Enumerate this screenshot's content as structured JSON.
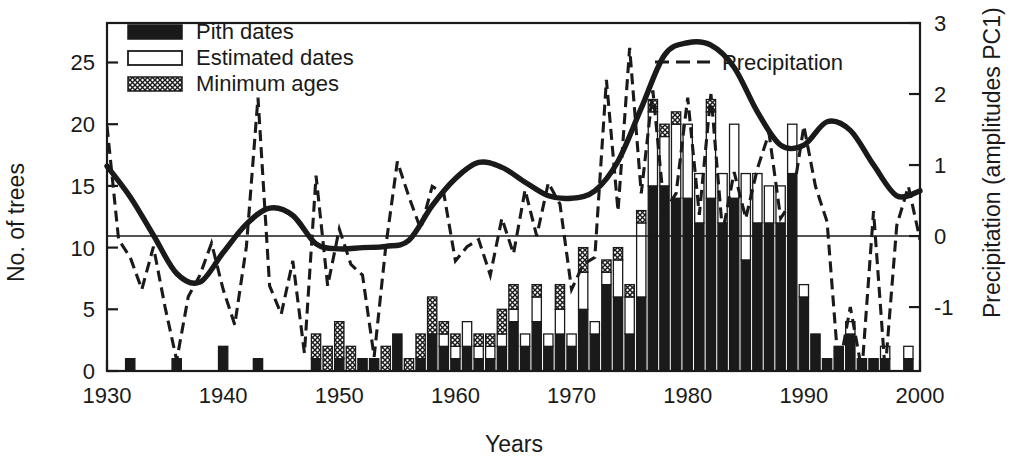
{
  "chart_data": {
    "type": "bar",
    "title": "",
    "xlabel": "Years",
    "ylabel": "No. of trees",
    "y2label": "Precipitation (amplitudes PC1)",
    "xlim": [
      1930,
      2000
    ],
    "ylim": [
      0,
      28.2
    ],
    "y2lim": [
      -1.9,
      3.0
    ],
    "xticks": [
      1930,
      1940,
      1950,
      1960,
      1970,
      1980,
      1990,
      2000
    ],
    "xticklabels": [
      "1930",
      "1940",
      "1950",
      "1960",
      "1970",
      "1980",
      "1990",
      "2000"
    ],
    "yticks": [
      0,
      5,
      10,
      15,
      20,
      25
    ],
    "yticklabels": [
      "0",
      "5",
      "10",
      "15",
      "20",
      "25"
    ],
    "y2ticks": [
      -1,
      0,
      1,
      2,
      3
    ],
    "y2ticklabels": [
      "-1",
      "0",
      "1",
      "2",
      "3"
    ],
    "grid": false,
    "zero_line_y2": 0,
    "legend_position": "top-left and top-right inside axes",
    "colors": {
      "pith": "#1a1a1a",
      "estimated": "#ffffff",
      "minimum": "#b4b4b4",
      "outline": "#1a1a1a",
      "precipitation": "#1a1a1a",
      "smoothed": "#1a1a1a"
    },
    "legend": [
      {
        "label": "Pith dates",
        "swatch": "filled-black"
      },
      {
        "label": "Estimated dates",
        "swatch": "open-white"
      },
      {
        "label": "Minimum ages",
        "swatch": "crosshatch"
      },
      {
        "label": "Precipitation",
        "swatch": "dashed-line"
      }
    ],
    "series": [
      {
        "name": "Pith dates",
        "type": "bar-stack-bottom",
        "categories": [
          1930,
          1931,
          1932,
          1933,
          1934,
          1935,
          1936,
          1937,
          1938,
          1939,
          1940,
          1941,
          1942,
          1943,
          1944,
          1945,
          1946,
          1947,
          1948,
          1949,
          1950,
          1951,
          1952,
          1953,
          1954,
          1955,
          1956,
          1957,
          1958,
          1959,
          1960,
          1961,
          1962,
          1963,
          1964,
          1965,
          1966,
          1967,
          1968,
          1969,
          1970,
          1971,
          1972,
          1973,
          1974,
          1975,
          1976,
          1977,
          1978,
          1979,
          1980,
          1981,
          1982,
          1983,
          1984,
          1985,
          1986,
          1987,
          1988,
          1989,
          1990,
          1991,
          1992,
          1993,
          1994,
          1995,
          1996,
          1997,
          1998,
          1999,
          2000
        ],
        "values": [
          0,
          0,
          1,
          0,
          0,
          0,
          1,
          0,
          0,
          0,
          2,
          0,
          0,
          1,
          0,
          0,
          0,
          0,
          1,
          0,
          1,
          0,
          1,
          1,
          0,
          3,
          0,
          1,
          3,
          2,
          1,
          2,
          1,
          1,
          2,
          4,
          2,
          4,
          2,
          3,
          2,
          5,
          3,
          7,
          6,
          3,
          6,
          15,
          15,
          14,
          14,
          12,
          14,
          12,
          14,
          9,
          12,
          12,
          12,
          16,
          6,
          3,
          1,
          2,
          3,
          1,
          1,
          1,
          0,
          1,
          0
        ]
      },
      {
        "name": "Estimated dates",
        "type": "bar-stack-middle",
        "values": [
          0,
          0,
          0,
          0,
          0,
          0,
          0,
          0,
          0,
          0,
          0,
          0,
          0,
          0,
          0,
          0,
          0,
          0,
          0,
          0,
          0,
          0,
          0,
          0,
          0,
          0,
          0,
          0,
          0,
          1,
          1,
          2,
          1,
          1,
          1,
          1,
          1,
          2,
          1,
          2,
          1,
          3,
          1,
          1,
          3,
          3,
          6,
          6,
          4,
          6,
          6,
          4,
          7,
          4,
          6,
          7,
          4,
          3,
          3,
          4,
          1,
          0,
          0,
          0,
          1,
          0,
          0,
          1,
          0,
          1,
          0
        ]
      },
      {
        "name": "Minimum ages",
        "type": "bar-stack-top",
        "values": [
          0,
          0,
          0,
          0,
          0,
          0,
          0,
          0,
          0,
          0,
          0,
          0,
          0,
          0,
          0,
          0,
          0,
          0,
          2,
          2,
          3,
          2,
          0,
          0,
          2,
          0,
          1,
          2,
          3,
          1,
          1,
          0,
          1,
          1,
          2,
          2,
          0,
          1,
          0,
          2,
          0,
          2,
          0,
          1,
          1,
          1,
          1,
          1,
          1,
          1,
          0,
          0,
          1,
          0,
          0,
          0,
          0,
          0,
          0,
          0,
          0,
          0,
          0,
          0,
          0,
          0,
          0,
          0,
          0,
          0,
          0
        ]
      },
      {
        "name": "Precipitation",
        "type": "line-dashed",
        "x": [
          1930,
          1931,
          1932,
          1933,
          1934,
          1935,
          1936,
          1937,
          1938,
          1939,
          1940,
          1941,
          1942,
          1943,
          1944,
          1945,
          1946,
          1947,
          1948,
          1949,
          1950,
          1951,
          1952,
          1953,
          1954,
          1955,
          1956,
          1957,
          1958,
          1959,
          1960,
          1961,
          1962,
          1963,
          1964,
          1965,
          1966,
          1967,
          1968,
          1969,
          1970,
          1971,
          1972,
          1973,
          1974,
          1975,
          1976,
          1977,
          1978,
          1979,
          1980,
          1981,
          1982,
          1983,
          1984,
          1985,
          1986,
          1987,
          1988,
          1989,
          1990,
          1991,
          1992,
          1993,
          1994,
          1995,
          1996,
          1997,
          1998,
          1999,
          2000
        ],
        "values": [
          1.55,
          -0.05,
          -0.3,
          -0.75,
          -0.15,
          -1.0,
          -1.75,
          -0.85,
          -0.55,
          -0.1,
          -0.75,
          -1.25,
          -0.15,
          1.95,
          -0.7,
          -1.1,
          -0.35,
          -1.65,
          0.85,
          -0.7,
          0.1,
          -0.4,
          -0.55,
          -1.7,
          -0.15,
          1.05,
          0.55,
          0.1,
          0.7,
          0.6,
          -0.35,
          -0.15,
          -0.05,
          -0.55,
          0.25,
          -0.25,
          0.65,
          0.0,
          0.75,
          0.45,
          -0.75,
          -0.4,
          -0.3,
          2.2,
          0.35,
          2.65,
          0.6,
          2.05,
          0.35,
          0.6,
          1.95,
          0.3,
          2.0,
          0.05,
          0.9,
          0.25,
          0.95,
          1.45,
          0.25,
          0.5,
          1.55,
          0.7,
          0.2,
          -1.9,
          -1.0,
          -1.9,
          0.35,
          -1.9,
          0.15,
          0.7,
          -0.05
        ]
      },
      {
        "name": "Smoothed trees",
        "type": "line-solid-thick",
        "x": [
          1930,
          1932,
          1934,
          1936,
          1938,
          1940,
          1942,
          1944,
          1946,
          1948,
          1950,
          1952,
          1954,
          1956,
          1958,
          1960,
          1962,
          1964,
          1966,
          1968,
          1970,
          1972,
          1974,
          1976,
          1978,
          1980,
          1982,
          1984,
          1986,
          1988,
          1990,
          1992,
          1994,
          1996,
          1998,
          2000
        ],
        "values": [
          16.6,
          14.1,
          11.0,
          7.9,
          7.2,
          9.6,
          11.9,
          13.2,
          12.6,
          10.3,
          9.9,
          10.0,
          10.1,
          10.6,
          13.4,
          15.6,
          16.9,
          16.5,
          15.3,
          14.2,
          14.0,
          14.6,
          17.0,
          21.3,
          25.6,
          26.6,
          26.4,
          24.6,
          21.0,
          18.3,
          18.3,
          20.2,
          19.5,
          16.7,
          14.2,
          14.6
        ]
      }
    ],
    "annotations": [
      {
        "text": "horizontal reference line at precipitation = 0"
      }
    ]
  }
}
